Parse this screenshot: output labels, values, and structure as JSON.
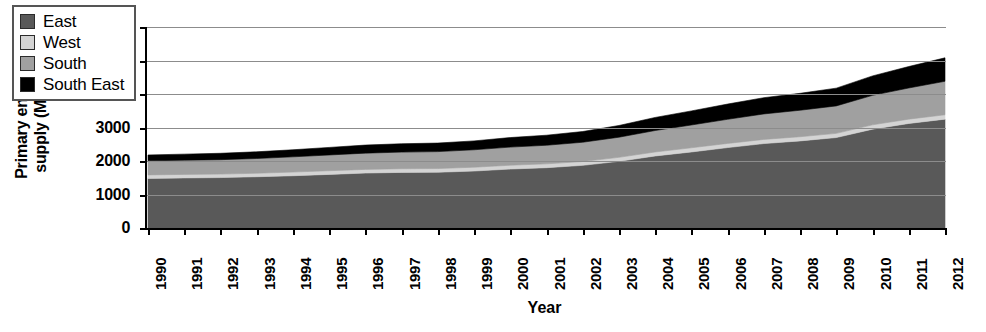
{
  "chart_data": {
    "type": "area",
    "stacked": true,
    "title": "",
    "xlabel": "Year",
    "ylabel": "Primary energy supply (Mtoe)",
    "ylabel_lines": [
      "Primary energy",
      "supply (Mtoe)"
    ],
    "ylim": [
      0,
      6000
    ],
    "ytick_labels": [
      "0",
      "1000",
      "2000",
      "3000",
      "4000",
      "5000",
      "6000"
    ],
    "ytick_values": [
      0,
      1000,
      2000,
      3000,
      4000,
      5000,
      6000
    ],
    "grid": true,
    "grid_axis": "y",
    "legend_position": "upper left inside",
    "categories": [
      "1990",
      "1991",
      "1992",
      "1993",
      "1994",
      "1995",
      "1996",
      "1997",
      "1998",
      "1999",
      "2000",
      "2001",
      "2002",
      "2003",
      "2004",
      "2005",
      "2006",
      "2007",
      "2008",
      "2009",
      "2010",
      "2011",
      "2012"
    ],
    "x": [
      1990,
      1991,
      1992,
      1993,
      1994,
      1995,
      1996,
      1997,
      1998,
      1999,
      2000,
      2001,
      2002,
      2003,
      2004,
      2005,
      2006,
      2007,
      2008,
      2009,
      2010,
      2011,
      2012
    ],
    "series": [
      {
        "name": "East",
        "color": "#595959",
        "values": [
          1480,
          1495,
          1505,
          1530,
          1560,
          1600,
          1640,
          1660,
          1665,
          1700,
          1760,
          1800,
          1870,
          1990,
          2150,
          2270,
          2400,
          2520,
          2600,
          2700,
          2950,
          3120,
          3250
        ]
      },
      {
        "name": "West",
        "color": "#d4d4d4",
        "values": [
          105,
          105,
          105,
          105,
          110,
          110,
          110,
          110,
          110,
          115,
          115,
          115,
          115,
          120,
          120,
          125,
          125,
          125,
          125,
          125,
          130,
          130,
          130
        ]
      },
      {
        "name": "South",
        "color": "#a0a0a0",
        "values": [
          420,
          425,
          430,
          440,
          455,
          470,
          485,
          495,
          505,
          520,
          540,
          555,
          575,
          600,
          640,
          680,
          720,
          760,
          790,
          820,
          880,
          930,
          1000
        ]
      },
      {
        "name": "South East",
        "color": "#000000",
        "values": [
          175,
          180,
          190,
          200,
          210,
          225,
          240,
          250,
          255,
          265,
          285,
          300,
          320,
          350,
          390,
          420,
          455,
          485,
          505,
          530,
          580,
          640,
          700
        ]
      }
    ],
    "totals": [
      2180,
      2205,
      2230,
      2275,
      2335,
      2405,
      2475,
      2515,
      2535,
      2600,
      2700,
      2770,
      2880,
      3060,
      3300,
      3495,
      3700,
      3890,
      4020,
      4175,
      4540,
      4820,
      5080
    ]
  },
  "legend": {
    "items": [
      {
        "label": "East",
        "color": "#595959"
      },
      {
        "label": "West",
        "color": "#d4d4d4"
      },
      {
        "label": "South",
        "color": "#a0a0a0"
      },
      {
        "label": "South East",
        "color": "#000000"
      }
    ]
  }
}
